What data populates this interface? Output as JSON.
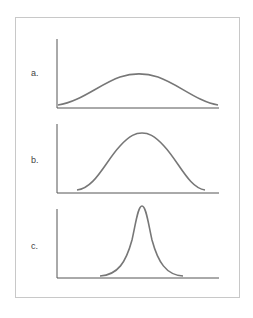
{
  "figure": {
    "frame_color": "#c8c8c8",
    "axis_color": "#555555",
    "curve_color": "#777777",
    "panels": [
      {
        "label": "a.",
        "description": "wide, low bell curve",
        "peak_x": 138,
        "spread": "wide"
      },
      {
        "label": "b.",
        "description": "medium bell curve",
        "peak_x": 142,
        "spread": "medium"
      },
      {
        "label": "c.",
        "description": "narrow, tall bell curve",
        "peak_x": 142,
        "spread": "narrow"
      }
    ]
  }
}
